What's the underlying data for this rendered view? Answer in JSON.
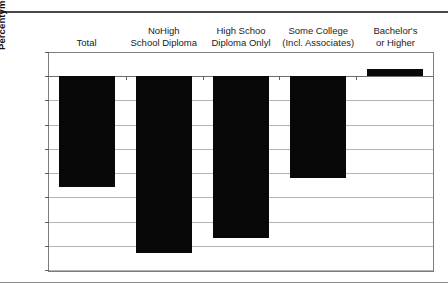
{
  "document": {
    "clipped_header_text": "",
    "rules": {
      "top": "rule",
      "bottom": "rule"
    }
  },
  "chart_data": {
    "type": "bar",
    "title": "",
    "xlabel": "",
    "ylabel": "Percentyment Change in Employ",
    "categories": [
      "Total",
      "NoHigh\nSchool Diploma",
      "High Schoo\nDiploma Onlyl",
      "Some College\n(Incl. Associates)",
      "Bachelor's\nor Higher"
    ],
    "values": [
      -4.6,
      -7.3,
      -6.7,
      -4.2,
      0.3
    ],
    "ylim": [
      -8.0,
      1.0
    ],
    "ytick_labels": [
      "1.0",
      "0.0",
      "-1.0",
      "-2.0",
      "-3.0",
      "-4.0",
      "-5.0",
      "-6.0",
      "-7.0",
      "-8.0"
    ],
    "ytick_values": [
      1.0,
      0.0,
      -1.0,
      -2.0,
      -3.0,
      -4.0,
      -5.0,
      -6.0,
      -7.0,
      -8.0
    ],
    "grid": true,
    "legend": "none",
    "bar_color": "#080808",
    "grid_color": "#b4b4b4",
    "axis_color": "#7c7c7c"
  }
}
